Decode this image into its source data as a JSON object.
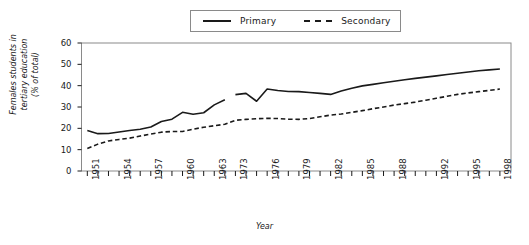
{
  "chart_data": {
    "type": "line",
    "title": "",
    "xlabel": "Year",
    "ylabel": "Females students in tertiary education (% of total)",
    "ylabel_lines": [
      "Females students in",
      "tertiary education",
      "(% of total)"
    ],
    "xlim": [
      1950,
      1998
    ],
    "ylim": [
      0,
      60
    ],
    "yticks": [
      0,
      10,
      20,
      30,
      40,
      50,
      60
    ],
    "xticks_labeled": [
      1951,
      1954,
      1957,
      1960,
      1963,
      1973,
      1976,
      1979,
      1982,
      1985,
      1988,
      1992,
      1995,
      1998
    ],
    "xticks_all": [
      1951,
      1952,
      1953,
      1954,
      1955,
      1956,
      1957,
      1958,
      1959,
      1960,
      1961,
      1962,
      1963,
      1964,
      1973,
      1974,
      1975,
      1976,
      1977,
      1978,
      1979,
      1980,
      1981,
      1982,
      1983,
      1984,
      1985,
      1986,
      1987,
      1988,
      1989,
      1990,
      1991,
      1992,
      1993,
      1994,
      1995,
      1996,
      1997,
      1998
    ],
    "grid": false,
    "legend_position": "top-center",
    "axis_note": "x-axis has a break between 1964 and 1973",
    "series": [
      {
        "name": "Primary",
        "style": "solid",
        "color": "#1a1a1a",
        "segments": [
          {
            "x": [
              1951,
              1952,
              1953,
              1954,
              1955,
              1956,
              1957,
              1958,
              1959,
              1960,
              1961,
              1962,
              1963,
              1964
            ],
            "values": [
              19.0,
              17.5,
              17.6,
              18.3,
              19.0,
              19.6,
              20.6,
              23.2,
              24.3,
              27.5,
              26.6,
              27.3,
              31.0,
              33.4
            ]
          },
          {
            "x": [
              1973,
              1974,
              1975,
              1976,
              1977,
              1978,
              1979,
              1980,
              1981,
              1982,
              1983,
              1984,
              1985,
              1986,
              1987,
              1988,
              1989,
              1990,
              1991,
              1992,
              1993,
              1994,
              1995,
              1996,
              1997,
              1998
            ],
            "values": [
              35.8,
              36.4,
              32.7,
              38.4,
              37.7,
              37.3,
              37.2,
              36.8,
              36.4,
              35.9,
              37.5,
              38.8,
              39.9,
              40.6,
              41.4,
              42.1,
              42.8,
              43.4,
              44.0,
              44.6,
              45.2,
              45.8,
              46.4,
              47.0,
              47.4,
              47.8
            ]
          }
        ]
      },
      {
        "name": "Secondary",
        "style": "dashed",
        "color": "#1a1a1a",
        "segments": [
          {
            "x": [
              1951,
              1952,
              1953,
              1954,
              1955,
              1956,
              1957,
              1958,
              1959,
              1960,
              1961,
              1962,
              1963,
              1964,
              1973,
              1974,
              1975,
              1976,
              1977,
              1978,
              1979,
              1980,
              1981,
              1982,
              1983,
              1984,
              1985,
              1986,
              1987,
              1988,
              1989,
              1990,
              1991,
              1992,
              1993,
              1994,
              1995,
              1996,
              1997,
              1998
            ],
            "values": [
              10.5,
              12.6,
              14.1,
              14.8,
              15.4,
              16.4,
              17.3,
              18.2,
              18.5,
              18.5,
              19.6,
              20.5,
              21.2,
              21.9,
              23.8,
              24.2,
              24.5,
              24.7,
              24.6,
              24.3,
              24.2,
              24.6,
              25.4,
              26.2,
              26.7,
              27.5,
              28.3,
              29.2,
              30.0,
              30.9,
              31.6,
              32.3,
              33.2,
              34.1,
              35.0,
              35.9,
              36.6,
              37.2,
              37.8,
              38.4
            ]
          }
        ]
      }
    ]
  },
  "legend": {
    "entries": [
      {
        "label": "Primary",
        "style": "solid"
      },
      {
        "label": "Secondary",
        "style": "dashed"
      }
    ]
  },
  "axes": {
    "x_title": "Year",
    "y_title_line1": "Females students in",
    "y_title_line2": "tertiary education",
    "y_title_line3": "(% of total)"
  }
}
